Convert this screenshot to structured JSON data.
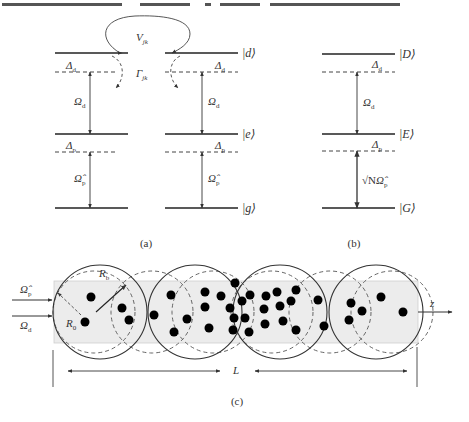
{
  "header_fragment": "……的动力学……H_int……ψ……(a)……(b)……",
  "panel_a": {
    "caption": "(a)",
    "coupling_label": "V",
    "coupling_sub": "jk",
    "decay_label": "Γ",
    "decay_sub": "jk",
    "left_atom": {
      "delta_d": "Δ",
      "delta_d_sub": "d",
      "omega_d": "Ω",
      "omega_d_sub": "d",
      "delta_p": "Δ",
      "delta_p_sub": "p",
      "omega_p": "Ω̂",
      "omega_p_sub": "p"
    },
    "right_atom": {
      "delta_d": "Δ",
      "delta_d_sub": "d",
      "omega_d": "Ω",
      "omega_d_sub": "d",
      "delta_p": "Δ",
      "delta_p_sub": "p",
      "omega_p": "Ω̂",
      "omega_p_sub": "p",
      "ket_d": "|d⟩",
      "ket_e": "|e⟩",
      "ket_g": "|g⟩"
    }
  },
  "panel_b": {
    "caption": "(b)",
    "delta_d": "Δ",
    "delta_d_sub": "d",
    "omega_d": "Ω",
    "omega_d_sub": "d",
    "delta_p": "Δ",
    "delta_p_sub": "p",
    "coupling_prefix": "√N",
    "coupling_omega": "Ω̂",
    "coupling_sub": "p",
    "ket_D": "|D⟩",
    "ket_E": "|E⟩",
    "ket_G": "|G⟩"
  },
  "panel_c": {
    "caption": "(c)",
    "input_probe": "Ω̂",
    "input_probe_sub": "p",
    "input_drive": "Ω",
    "input_drive_sub": "d",
    "radius_blockade": "R",
    "radius_blockade_sub": "b",
    "radius_zero": "R",
    "radius_zero_sub": "0",
    "axis_label": "z",
    "length_label": "L",
    "colors": {
      "medium_fill": "#ececec",
      "atom": "#000000",
      "line": "#333333"
    },
    "atom_count": 36
  }
}
